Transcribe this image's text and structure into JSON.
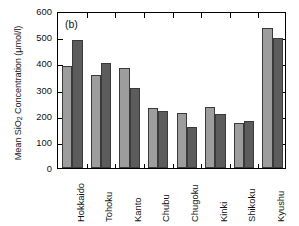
{
  "chart_data": {
    "type": "bar",
    "title": "",
    "panel_label": "(b)",
    "xlabel": "",
    "ylabel": "Mean SiO2 Concentration (µmol/l)",
    "ylabel_parts": {
      "pre": "Mean SiO",
      "sub": "2",
      "post": " Concentration (µmol/l)"
    },
    "categories": [
      "Hokkaido",
      "Tohoku",
      "Kanto",
      "Chubu",
      "Chugoku",
      "Kinki",
      "Shikoku",
      "Kyushu"
    ],
    "series": [
      {
        "name": "series-light",
        "color": "#9d9d9d",
        "values": [
          390,
          355,
          382,
          228,
          212,
          235,
          172,
          535
        ]
      },
      {
        "name": "series-dark",
        "color": "#5c5c5c",
        "values": [
          490,
          400,
          305,
          218,
          158,
          205,
          178,
          495
        ]
      }
    ],
    "ylim": [
      0,
      600
    ],
    "yticks": [
      0,
      100,
      200,
      300,
      400,
      500,
      600
    ],
    "ytick_labels": [
      "0",
      "100",
      "200",
      "300",
      "400",
      "500",
      "600"
    ],
    "grid": false,
    "legend": "none",
    "axis_ticks": "inward on all four sides",
    "frame": "full box"
  }
}
